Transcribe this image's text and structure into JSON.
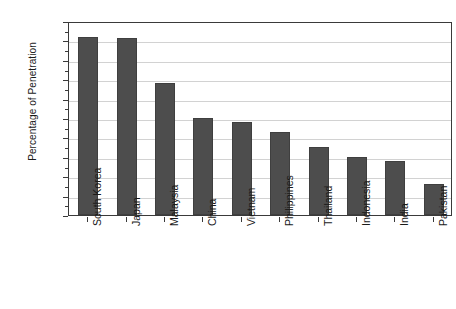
{
  "chart_data": {
    "type": "bar",
    "title": "",
    "subtitle": "",
    "xlabel": "",
    "ylabel": "Percentage of Penetration",
    "ylim": [
      0,
      100
    ],
    "ytick_step": 10,
    "grid": true,
    "legend": false,
    "bar_color": "#4d4d4d",
    "axis_color": "#3a3a3a",
    "grid_color": "#d2d2d2",
    "categories": [
      "South Korea",
      "Japan",
      "Malaysia",
      "China",
      "Vietnam",
      "Philippines",
      "Thailand",
      "Indonesia",
      "India",
      "Pakistan"
    ],
    "values": [
      92,
      91,
      68,
      50,
      48,
      43,
      35,
      30,
      28,
      16
    ],
    "ytick_labels": [
      "100",
      "90",
      "80",
      "70",
      "60",
      "50",
      "40",
      "30",
      "20",
      "10",
      "0"
    ],
    "ytick_values": [
      100,
      90,
      80,
      70,
      60,
      50,
      40,
      30,
      20,
      10,
      0
    ]
  }
}
